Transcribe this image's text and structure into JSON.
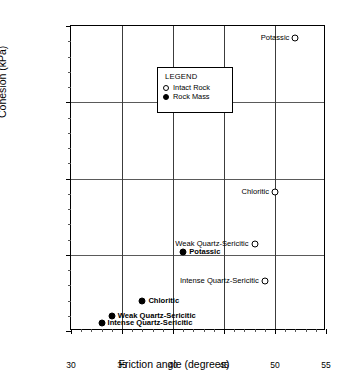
{
  "chart_data": {
    "type": "scatter",
    "title": "",
    "xlabel": "Friction angle (degrees)",
    "ylabel": "Cohesion (kPa)",
    "xlim": [
      30,
      55
    ],
    "ylim": [
      0,
      20000
    ],
    "xticks": [
      30,
      35,
      40,
      45,
      50,
      55
    ],
    "yticks": [
      0,
      5000,
      10000,
      15000,
      20000
    ],
    "xtick_labels": [
      "30",
      "35",
      "40",
      "45",
      "50",
      "55"
    ],
    "ytick_labels": [
      "0",
      "5000",
      "10000",
      "15000",
      "20000"
    ],
    "grid": true,
    "legend_position": "upper-left-inset",
    "legend_title": "LEGEND",
    "series": [
      {
        "name": "Intact Rock",
        "marker": "open-circle",
        "points": [
          {
            "label": "Potassic",
            "x": 52,
            "y": 19200,
            "label_side": "left",
            "bold": false
          },
          {
            "label": "Chloritic",
            "x": 50,
            "y": 9100,
            "label_side": "left",
            "bold": false
          },
          {
            "label": "Weak Quartz-Sericitic",
            "x": 48,
            "y": 5700,
            "label_side": "left",
            "bold": false
          },
          {
            "label": "Intense Quartz-Sericitic",
            "x": 49,
            "y": 3300,
            "label_side": "left",
            "bold": false
          }
        ]
      },
      {
        "name": "Rock Mass",
        "marker": "filled-circle",
        "points": [
          {
            "label": "Potassic",
            "x": 41,
            "y": 5150,
            "label_side": "right",
            "bold": true
          },
          {
            "label": "Chloritic",
            "x": 37,
            "y": 2000,
            "label_side": "right",
            "bold": true
          },
          {
            "label": "Weak Quartz-Sericitic",
            "x": 34,
            "y": 1000,
            "label_side": "right",
            "bold": true
          },
          {
            "label": "Intense Quartz-Sericitic",
            "x": 33,
            "y": 500,
            "label_side": "right",
            "bold": true
          }
        ]
      }
    ]
  }
}
